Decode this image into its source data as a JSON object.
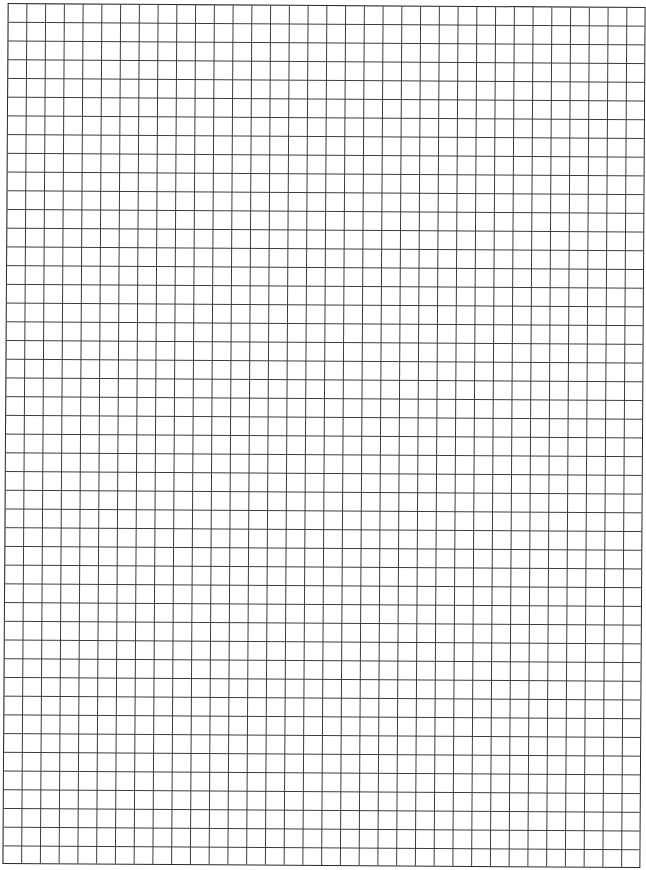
{
  "page": {
    "type": "graph-paper"
  },
  "grid": {
    "columns": 34,
    "rows": 46,
    "cell_size_px": 18.7,
    "line_color": "#3a3a3a",
    "border_color": "#2a2a2a",
    "background_color": "#ffffff"
  }
}
